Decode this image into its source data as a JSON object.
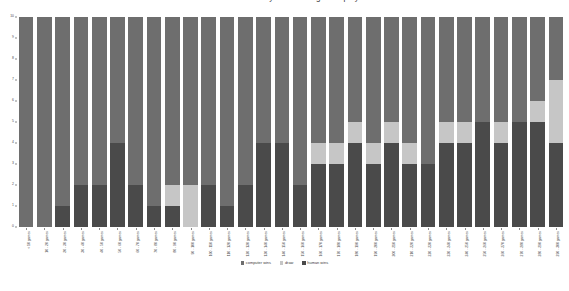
{
  "chart_data": {
    "type": "bar",
    "title": "Game outcomes by number of games played",
    "xlabel": "",
    "ylabel": "",
    "ylim": [
      0,
      10
    ],
    "yticks": [
      0,
      1,
      2,
      3,
      4,
      5,
      6,
      7,
      8,
      9,
      10
    ],
    "grid": false,
    "stacked": true,
    "legend_position": "bottom-center",
    "categories": [
      "< 10 games",
      "10 - 20 games",
      "20 - 30 games",
      "30 - 40 games",
      "40 - 50 games",
      "50 - 60 games",
      "60 - 70 games",
      "70 - 80 games",
      "80 - 90 games",
      "90 - 100 games",
      "100 - 110 games",
      "110 - 120 games",
      "120 - 130 games",
      "130 - 140 games",
      "140 - 150 games",
      "150 - 160 games",
      "160 - 170 games",
      "170 - 180 games",
      "180 - 190 games",
      "190 - 200 games",
      "200 - 210 games",
      "210 - 220 games",
      "220 - 230 games",
      "230 - 240 games",
      "240 - 250 games",
      "250 - 260 games",
      "260 - 270 games",
      "270 - 280 games",
      "280 - 290 games",
      "290 - 300 games"
    ],
    "series": [
      {
        "name": "computer wins",
        "color": "#6e6e6e",
        "values": [
          10,
          10,
          9,
          8,
          8,
          6,
          8,
          9,
          8,
          8,
          8,
          9,
          8,
          6,
          6,
          8,
          6,
          6,
          5,
          6,
          5,
          6,
          7,
          5,
          5,
          5,
          5,
          5,
          4,
          3
        ]
      },
      {
        "name": "draw",
        "color": "#c6c6c6",
        "values": [
          0,
          0,
          0,
          0,
          0,
          0,
          0,
          0,
          1,
          2,
          0,
          0,
          0,
          0,
          0,
          0,
          1,
          1,
          1,
          1,
          1,
          1,
          0,
          1,
          1,
          0,
          1,
          0,
          1,
          3
        ]
      },
      {
        "name": "human wins",
        "color": "#4a4a4a",
        "values": [
          0,
          0,
          1,
          2,
          2,
          4,
          2,
          1,
          1,
          0,
          2,
          1,
          2,
          4,
          4,
          2,
          3,
          3,
          4,
          3,
          4,
          3,
          3,
          4,
          4,
          5,
          4,
          5,
          5,
          4
        ]
      }
    ]
  },
  "legend": {
    "items": [
      {
        "label": "computer wins",
        "color": "#6e6e6e"
      },
      {
        "label": "draw",
        "color": "#c6c6c6"
      },
      {
        "label": "human wins",
        "color": "#4a4a4a"
      }
    ]
  }
}
